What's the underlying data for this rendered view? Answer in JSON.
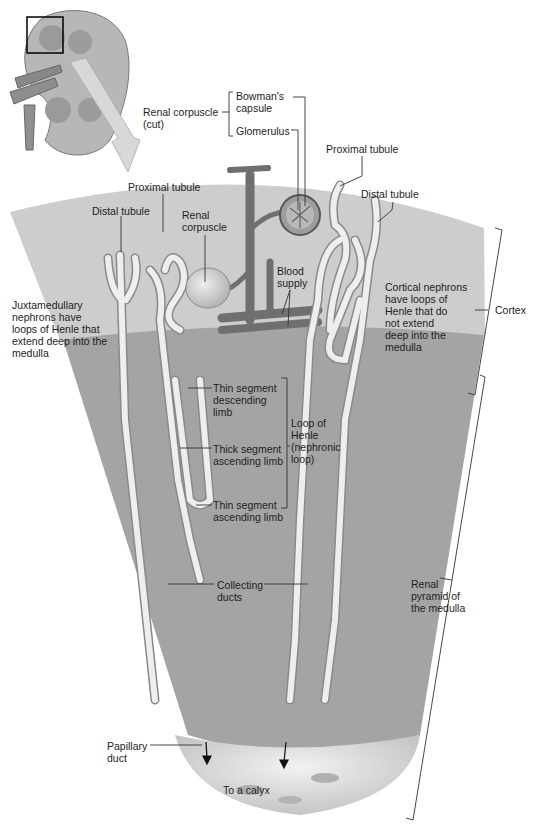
{
  "figure": {
    "colors": {
      "background": "#ffffff",
      "cortex": "#cbcbcb",
      "medulla": "#a3a3a3",
      "calyx": "#d9d9d9",
      "tubule": "#efefef",
      "tubule_outline": "#8a8a8a",
      "vessels": "#6e6e6e",
      "leader_lines": "#333333"
    }
  },
  "inset": {
    "name": "kidney-overview",
    "highlight_box": "selected cortex region"
  },
  "labels": {
    "renal_corpuscle_cut": "Renal corpuscle\n(cut)",
    "bowmans_capsule": "Bowman's\ncapsule",
    "glomerulus": "Glomerulus",
    "proximal_tubule_right": "Proximal tubule",
    "proximal_tubule_left": "Proximal tubule",
    "distal_tubule_left": "Distal tubule",
    "distal_tubule_right": "Distal tubule",
    "renal_corpuscle": "Renal\ncorpuscle",
    "blood_supply": "Blood\nsupply",
    "juxtamedullary": "Juxtamedullary\nnephrons have\nloops of Henle that\nextend deep into the\nmedulla",
    "cortical_nephrons": "Cortical nephrons\nhave loops of\nHenle that do\nnot extend\ndeep into the\nmedulla",
    "cortex": "Cortex",
    "thin_desc": "Thin segment\ndescending\nlimb",
    "thick_asc": "Thick segment\nascending limb",
    "thin_asc": "Thin segment\nascending limb",
    "loop_of_henle": "Loop of\nHenle\n(nephronic\nloop)",
    "collecting_ducts": "Collecting\nducts",
    "renal_pyramid": "Renal\npyramid of\nthe medulla",
    "papillary_duct": "Papillary\nduct",
    "to_a_calyx": "To a calyx"
  }
}
